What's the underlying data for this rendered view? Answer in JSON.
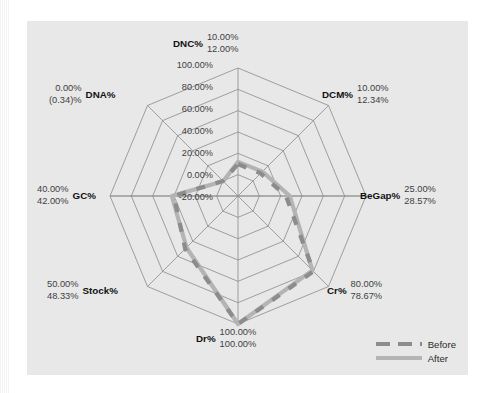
{
  "chart_data": {
    "type": "radar",
    "title": "",
    "categories": [
      "DNC%",
      "DCM%",
      "BeGap%",
      "Cr%",
      "Dr%",
      "Stock%",
      "GC%",
      "DNA%"
    ],
    "series": [
      {
        "name": "Before",
        "color": "#8c8c8c",
        "style": "dashed",
        "values": [
          10.0,
          10.0,
          25.0,
          80.0,
          100.0,
          50.0,
          40.0,
          0.0
        ],
        "labels": [
          "10.00%",
          "10.00%",
          "25.00%",
          "80.00%",
          "100.00%",
          "50.00%",
          "40.00%",
          "0.00%"
        ]
      },
      {
        "name": "After",
        "color": "#b4b4b4",
        "style": "solid",
        "values": [
          12.0,
          12.34,
          28.57,
          78.67,
          100.0,
          48.33,
          42.0,
          -0.34
        ],
        "labels": [
          "12.00%",
          "12.34%",
          "28.57%",
          "78.67%",
          "100.00%",
          "48.33%",
          "42.00%",
          "(0.34)%"
        ]
      }
    ],
    "radial_ticks": [
      -20,
      0,
      20,
      40,
      60,
      80,
      100
    ],
    "radial_tick_labels": [
      "-20.00%",
      "0.00%",
      "20.00%",
      "40.00%",
      "60.00%",
      "80.00%",
      "100.00%"
    ],
    "rlim": [
      -20,
      100
    ],
    "grid": true,
    "legend_position": "bottom-right",
    "xlabel": "",
    "ylabel": ""
  },
  "axis_labels": [
    {
      "name": "DNC%",
      "before": "10.00%",
      "after": "12.00%"
    },
    {
      "name": "DCM%",
      "before": "10.00%",
      "after": "12.34%"
    },
    {
      "name": "BeGap%",
      "before": "25.00%",
      "after": "28.57%"
    },
    {
      "name": "Cr%",
      "before": "80.00%",
      "after": "78.67%"
    },
    {
      "name": "Dr%",
      "before": "100.00%",
      "after": "100.00%"
    },
    {
      "name": "Stock%",
      "before": "50.00%",
      "after": "48.33%"
    },
    {
      "name": "GC%",
      "before": "40.00%",
      "after": "42.00%"
    },
    {
      "name": "DNA%",
      "before": "0.00%",
      "after": "(0.34)%"
    }
  ],
  "ticks": {
    "t100": "100.00%",
    "t80": "80.00%",
    "t60": "60.00%",
    "t40": "40.00%",
    "t20": "20.00%",
    "t0": "0.00%",
    "tm20": "-20.00%"
  },
  "legend": {
    "before_label": "Before",
    "after_label": "After"
  },
  "colors": {
    "plot_background": "#e8e8e8",
    "page_background": "#ffffff",
    "grid_line": "#8a8a8a",
    "before_series": "#8c8c8c",
    "after_series": "#b4b4b4",
    "text": "#1a1a1a"
  }
}
